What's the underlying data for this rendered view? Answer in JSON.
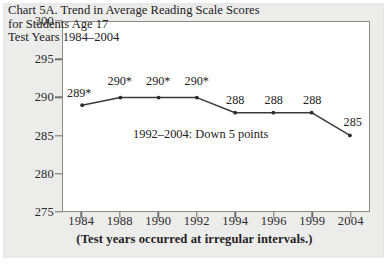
{
  "chart_data": {
    "type": "line",
    "title": "Chart 5A. Trend in Average Reading Scale Scores",
    "title_lines": [
      "Chart 5A. Trend in Average Reading Scale Scores",
      "for Students Age 17",
      "Test Years 1984–2004"
    ],
    "subtitle": "Test Years 1984–2004",
    "xlabel": "",
    "ylabel": "",
    "categories": [
      "1984",
      "1988",
      "1990",
      "1992",
      "1994",
      "1996",
      "1999",
      "2004"
    ],
    "values": [
      289,
      290,
      290,
      290,
      288,
      288,
      288,
      285
    ],
    "point_labels": [
      "289*",
      "290*",
      "290*",
      "290*",
      "288",
      "288",
      "288",
      "285"
    ],
    "ylim": [
      275,
      300
    ],
    "yticks": [
      300,
      295,
      290,
      285,
      280,
      275
    ],
    "grid": false,
    "legend": "none",
    "annotations": [
      "1992–2004: Down 5 points"
    ],
    "footnote": "(Test years occurred at irregular intervals.)",
    "series_color": "#3a3a3a",
    "marker_color": "#2a2a2a",
    "frame_color": "#8a8a8a",
    "text_color": "#222222",
    "plot_background": "#ffffff",
    "page_background": "#ececeb"
  },
  "annotation": {
    "trend_note": "1992–2004: Down 5 points"
  },
  "footer": {
    "note": "(Test years occurred at irregular intervals.)"
  }
}
